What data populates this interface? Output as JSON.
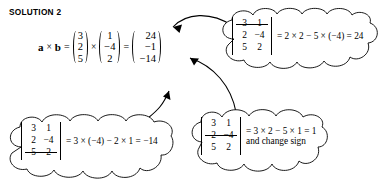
{
  "heading": {
    "text": "SOLUTION 2"
  },
  "main_equation": {
    "lhs_a": "a",
    "cross_1": "×",
    "lhs_b": "b",
    "equals_1": "=",
    "vector_a": [
      "3",
      "2",
      "5"
    ],
    "cross_2": "×",
    "vector_b": [
      "1",
      "−4",
      "2"
    ],
    "equals_2": "=",
    "vector_result": [
      "24",
      "−1",
      "−14"
    ]
  },
  "callouts": [
    {
      "id": "top-right",
      "name": "callout-component-i",
      "matrix_rows": [
        {
          "cells": [
            "3",
            "1"
          ],
          "struck": true
        },
        {
          "cells": [
            "2",
            "−4"
          ],
          "struck": false
        },
        {
          "cells": [
            "5",
            "2"
          ],
          "struck": false
        }
      ],
      "expression": "= 2 × 2 − 5 × (−4) = 24",
      "note": ""
    },
    {
      "id": "bottom-right",
      "name": "callout-component-j",
      "matrix_rows": [
        {
          "cells": [
            "3",
            "1"
          ],
          "struck": false
        },
        {
          "cells": [
            "2",
            "−4"
          ],
          "struck": true
        },
        {
          "cells": [
            "5",
            "2"
          ],
          "struck": false
        }
      ],
      "expression": "= 3 × 2 − 5 × 1 = 1",
      "note": "and change sign"
    },
    {
      "id": "bottom-left",
      "name": "callout-component-k",
      "matrix_rows": [
        {
          "cells": [
            "3",
            "1"
          ],
          "struck": false
        },
        {
          "cells": [
            "2",
            "−4"
          ],
          "struck": false
        },
        {
          "cells": [
            "5",
            "2"
          ],
          "struck": true
        }
      ],
      "expression": "= 3 × (−4) − 2 × 1 = −14",
      "note": ""
    }
  ],
  "arrows": [
    {
      "name": "arrow-to-first-component",
      "from": "callout-component-i",
      "to": "result-24"
    },
    {
      "name": "arrow-to-second-component",
      "from": "callout-component-j",
      "to": "result-minus-1"
    },
    {
      "name": "arrow-to-third-component",
      "from": "callout-component-k",
      "to": "result-minus-14"
    }
  ],
  "colors": {
    "ink": "#000000",
    "paper": "#ffffff"
  }
}
